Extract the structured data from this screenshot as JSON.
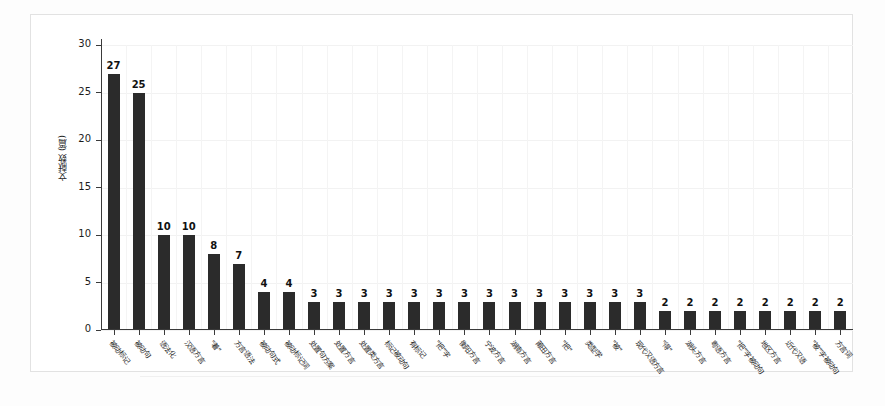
{
  "chart_data": {
    "type": "bar",
    "title": "",
    "xlabel": "",
    "ylabel": "文献数 (篇)",
    "ylim": [
      0,
      30
    ],
    "yticks": [
      0,
      5,
      10,
      15,
      20,
      25,
      30
    ],
    "grid": true,
    "legend": false,
    "orientation": "vertical",
    "bar_color": "#2b2b2b",
    "categories": [
      "被动标记",
      "被动句",
      "语法化",
      "汉语方言",
      "\"着\"",
      "方言语法",
      "被动句式",
      "被动标记词",
      "处置句方案",
      "处置方言",
      "处置类方言",
      "标记被动句",
      "有标记",
      "\"把\"字",
      "衡阳方言",
      "宁波方言",
      "湖南方言",
      "莆田方言",
      "\"把\"",
      "类型学",
      "\"被\"",
      "现代汉语方言",
      "\"得\"",
      "湖头方言",
      "粤语方言",
      "\"把\"字被动句",
      "地区方言",
      "近代汉语",
      "\"被\"字被动句",
      "方言词"
    ],
    "values": [
      27,
      25,
      10,
      10,
      8,
      7,
      4,
      4,
      3,
      3,
      3,
      3,
      3,
      3,
      3,
      3,
      3,
      3,
      3,
      3,
      3,
      3,
      2,
      2,
      2,
      2,
      2,
      2,
      2,
      2
    ]
  },
  "caption": {
    "text": ""
  }
}
